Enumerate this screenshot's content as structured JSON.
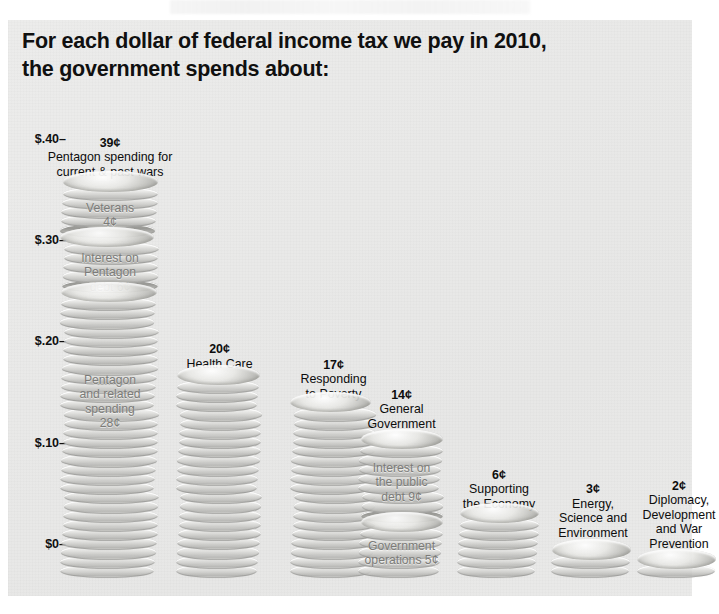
{
  "title": {
    "line1": "For each dollar of federal income tax we pay in 2010,",
    "line2": "the government spends about:"
  },
  "axis": {
    "ticks": [
      "$.40–",
      "$.30–",
      "$.20–",
      "$.10–",
      "$0–"
    ]
  },
  "chart_data": {
    "type": "bar",
    "title": "For each dollar of federal income tax we pay in 2010, the government spends about:",
    "xlabel": "",
    "ylabel": "",
    "ylim": [
      0,
      0.44
    ],
    "units": "cents per tax dollar",
    "grid": false,
    "legend": "none",
    "tick_labels": [
      "$0–",
      "$.10–",
      "$.20–",
      "$.30–",
      "$.40–"
    ],
    "tick_values": [
      0,
      10,
      20,
      30,
      40
    ],
    "categories": [
      "Pentagon spending for current & past wars",
      "Health Care",
      "Responding to Poverty",
      "General Government",
      "Supporting the Economy",
      "Energy, Science and Environment",
      "Diplomacy, Development and War Prevention"
    ],
    "values": [
      39,
      20,
      17,
      14,
      6,
      3,
      2
    ],
    "value_labels": [
      "39¢",
      "20¢",
      "17¢",
      "14¢",
      "6¢",
      "3¢",
      "2¢"
    ],
    "stacked_segments": {
      "Pentagon spending for current & past wars": [
        {
          "label": "Pentagon and related spending 28¢",
          "value": 28
        },
        {
          "label": "Interest on Pentagon debt 6¢",
          "value": 6
        },
        {
          "label": "Veterans 4¢",
          "value": 4
        }
      ],
      "General Government": [
        {
          "label": "Government operations 5¢",
          "value": 5
        },
        {
          "label": "Interest on the public debt 9¢",
          "value": 9
        }
      ]
    }
  },
  "columns": [
    {
      "id": "pentagon",
      "amount": "39¢",
      "name_line1": "Pentagon spending for",
      "name_line2": "current & past wars",
      "segments": [
        {
          "id": "veterans",
          "line1": "Veterans",
          "line2": "4¢",
          "line3": "",
          "line4": ""
        },
        {
          "id": "pentagon-debt",
          "line1": "Interest on",
          "line2": "Pentagon",
          "line3": "debt 6¢",
          "line4": ""
        },
        {
          "id": "pentagon-related",
          "line1": "Pentagon",
          "line2": "and related",
          "line3": "spending",
          "line4": "28¢"
        }
      ]
    },
    {
      "id": "health-care",
      "amount": "20¢",
      "name_line1": "Health Care",
      "name_line2": "",
      "segments": []
    },
    {
      "id": "poverty",
      "amount": "17¢",
      "name_line1": "Responding",
      "name_line2": "to Poverty",
      "segments": []
    },
    {
      "id": "general-government",
      "amount": "14¢",
      "name_line1": "General",
      "name_line2": "Government",
      "segments": [
        {
          "id": "public-debt",
          "line1": "Interest on",
          "line2": "the public",
          "line3": "debt 9¢",
          "line4": ""
        },
        {
          "id": "govt-operations",
          "line1": "Government",
          "line2": "operations 5¢",
          "line3": "",
          "line4": ""
        }
      ]
    },
    {
      "id": "economy",
      "amount": "6¢",
      "name_line1": "Supporting",
      "name_line2": "the Economy",
      "segments": []
    },
    {
      "id": "energy",
      "amount": "3¢",
      "name_line1": "Energy,",
      "name_line2": "Science and",
      "name_line3": "Environment",
      "segments": []
    },
    {
      "id": "diplomacy",
      "amount": "2¢",
      "name_line1": "Diplomacy,",
      "name_line2": "Development",
      "name_line3": "and War",
      "name_line4": "Prevention",
      "segments": []
    }
  ]
}
